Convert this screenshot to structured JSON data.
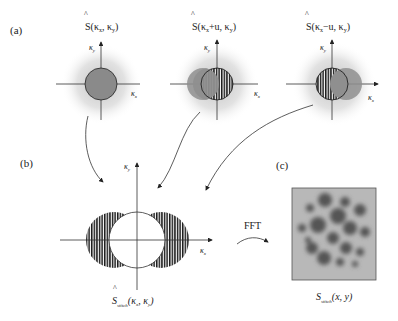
{
  "panels": {
    "a": {
      "label": "(a)",
      "plots": [
        {
          "title_main": "S",
          "title_args": "(κ",
          "title_sub1": "x",
          "title_mid": ", κ",
          "title_sub2": "y",
          "title_end": ")",
          "axis_x": "κ",
          "axis_x_sub": "x",
          "axis_y": "κ",
          "axis_y_sub": "y",
          "shift": "none"
        },
        {
          "title_main": "S",
          "title_args": "(κ",
          "title_sub1": "x",
          "title_mid": "+u, κ",
          "title_sub2": "y",
          "title_end": ")",
          "axis_x": "κ",
          "axis_x_sub": "x",
          "axis_y": "κ",
          "axis_y_sub": "y",
          "shift": "+u"
        },
        {
          "title_main": "S",
          "title_args": "(κ",
          "title_sub1": "x",
          "title_mid": "−u, κ",
          "title_sub2": "y",
          "title_end": ")",
          "axis_x": "κ",
          "axis_x_sub": "x",
          "axis_y": "κ",
          "axis_y_sub": "y",
          "shift": "−u"
        }
      ]
    },
    "b": {
      "label": "(b)",
      "axis_x": "κ",
      "axis_x_sub": "x",
      "axis_y": "κ",
      "axis_y_sub": "y",
      "caption_main": "S",
      "caption_sub": "stitch",
      "caption_args": "(κ",
      "caption_s1": "x",
      "caption_mid": ", κ",
      "caption_s2": "y",
      "caption_end": ")"
    },
    "c": {
      "label": "(c)",
      "caption_main": "S",
      "caption_sub": "stitch",
      "caption_args": "(x, y)"
    },
    "transform_label": "FFT"
  },
  "colors": {
    "pupil_fill": "#8a8a8a",
    "halo": "#c8c8c8",
    "hatch": "#1a1a1a",
    "image_bg": "#b8b8b8",
    "blob": "#5a5a5a"
  }
}
